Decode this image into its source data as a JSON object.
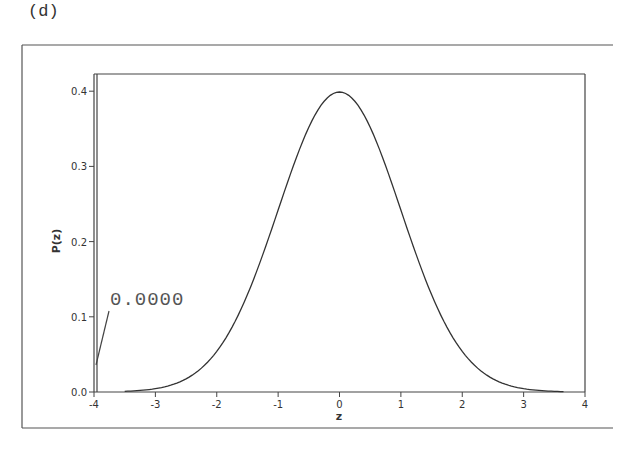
{
  "figure": {
    "panel_label": "(d)",
    "annotation": "0.0000"
  },
  "chart_data": {
    "type": "line",
    "title": "",
    "xlabel": "z",
    "ylabel": "P(z)",
    "xlim": [
      -4,
      4
    ],
    "ylim": [
      0,
      0.42
    ],
    "grid": false,
    "legend": null,
    "x_ticks": [
      "-4",
      "-3",
      "-2",
      "-1",
      "0",
      "1",
      "2",
      "3",
      "4"
    ],
    "y_ticks": [
      "0.0",
      "0.1",
      "0.2",
      "0.3",
      "0.4"
    ],
    "series": [
      {
        "name": "Standard normal density P(z)",
        "x": [
          -4,
          -3.5,
          -3,
          -2.5,
          -2,
          -1.5,
          -1,
          -0.5,
          0,
          0.5,
          1,
          1.5,
          2,
          2.5,
          3,
          3.5,
          4
        ],
        "values": [
          0.0001,
          0.0009,
          0.0044,
          0.0175,
          0.054,
          0.1295,
          0.242,
          0.3521,
          0.3989,
          0.3521,
          0.242,
          0.1295,
          0.054,
          0.0175,
          0.0044,
          0.0009,
          0.0001
        ]
      }
    ],
    "annotations": [
      {
        "text": "0.0000",
        "points_to": {
          "x": -4,
          "y": 0.035
        },
        "note": "leader line from label to left boundary at z=-4"
      }
    ],
    "markers": [
      {
        "type": "vertical-line",
        "x": -4,
        "from_y": 0,
        "to_y": 0.42
      }
    ]
  }
}
